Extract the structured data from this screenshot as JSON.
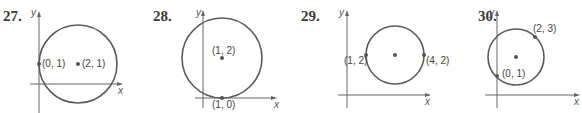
{
  "figures": [
    {
      "number": "27.",
      "axis_x_label": "x",
      "axis_y_label": "y",
      "points": [
        {
          "label": "(0, 1)",
          "role": "point-on-circle"
        },
        {
          "label": "(2, 1)",
          "role": "center"
        }
      ]
    },
    {
      "number": "28.",
      "axis_x_label": "x",
      "axis_y_label": "y",
      "points": [
        {
          "label": "(1, 2)",
          "role": "center"
        },
        {
          "label": "(1, 0)",
          "role": "point-on-circle"
        }
      ]
    },
    {
      "number": "29.",
      "axis_x_label": "x",
      "axis_y_label": "y",
      "points": [
        {
          "label": "(1, 2)",
          "role": "endpoint-of-diameter"
        },
        {
          "label": "(4, 2)",
          "role": "endpoint-of-diameter"
        }
      ]
    },
    {
      "number": "30.",
      "axis_x_label": "x",
      "axis_y_label": "y",
      "points": [
        {
          "label": "(2, 3)",
          "role": "endpoint-of-diameter"
        },
        {
          "label": "(0, 1)",
          "role": "endpoint-of-diameter"
        }
      ]
    }
  ],
  "colors": {
    "circle": "#5a5a5a",
    "axis": "#666666",
    "point": "#555555"
  }
}
